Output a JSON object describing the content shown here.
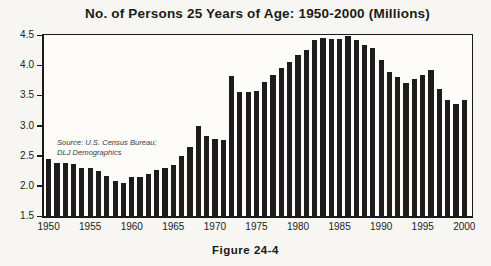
{
  "figure": {
    "title": "No. of Persons 25 Years of Age: 1950-2000 (Millions)",
    "source_line1": "Source: U.S. Census Bureau;",
    "source_line2": "DLJ Demographics",
    "caption": "Figure 24-4"
  },
  "colors": {
    "ink": "#1c1c1c",
    "paper": "#f7f6f2",
    "plot_background": "#fdfcf9"
  },
  "chart_data": {
    "type": "bar",
    "title": "No. of Persons 25 Years of Age: 1950-2000 (Millions)",
    "xlabel": "",
    "ylabel": "",
    "ylim": [
      1.5,
      4.5
    ],
    "yticks": [
      1.5,
      2.0,
      2.5,
      3.0,
      3.5,
      4.0,
      4.5
    ],
    "xticks": [
      1950,
      1955,
      1960,
      1965,
      1970,
      1975,
      1980,
      1985,
      1990,
      1995,
      2000
    ],
    "grid": false,
    "legend": "none",
    "bar_color": "#1c1c1c",
    "annotation": "Source: U.S. Census Bureau; DLJ Demographics",
    "caption": "Figure 24-4",
    "categories": [
      1950,
      1951,
      1952,
      1953,
      1954,
      1955,
      1956,
      1957,
      1958,
      1959,
      1960,
      1961,
      1962,
      1963,
      1964,
      1965,
      1966,
      1967,
      1968,
      1969,
      1970,
      1971,
      1972,
      1973,
      1974,
      1975,
      1976,
      1977,
      1978,
      1979,
      1980,
      1981,
      1982,
      1983,
      1984,
      1985,
      1986,
      1987,
      1988,
      1989,
      1990,
      1991,
      1992,
      1993,
      1994,
      1995,
      1996,
      1997,
      1998,
      1999,
      2000
    ],
    "values": [
      2.44,
      2.38,
      2.38,
      2.37,
      2.29,
      2.29,
      2.25,
      2.17,
      2.08,
      2.05,
      2.15,
      2.15,
      2.19,
      2.26,
      2.3,
      2.34,
      2.5,
      2.64,
      3.0,
      2.83,
      2.78,
      2.76,
      3.82,
      3.56,
      3.56,
      3.57,
      3.72,
      3.83,
      3.95,
      4.06,
      4.17,
      4.25,
      4.42,
      4.45,
      4.44,
      4.43,
      4.49,
      4.42,
      4.33,
      4.28,
      4.08,
      3.88,
      3.8,
      3.71,
      3.77,
      3.84,
      3.92,
      3.61,
      3.43,
      3.35,
      3.43
    ]
  }
}
